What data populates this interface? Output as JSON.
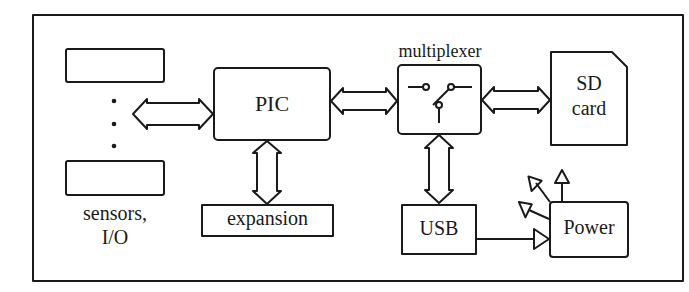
{
  "diagram": {
    "type": "block-diagram",
    "blocks": {
      "sensor_top": "",
      "sensor_bottom": "",
      "sensors_label_line1": "sensors,",
      "sensors_label_line2": "I/O",
      "pic": "PIC",
      "expansion": "expansion",
      "multiplexer": "multiplexer",
      "sd_line1": "SD",
      "sd_line2": "card",
      "usb": "USB",
      "power": "Power"
    },
    "connections": [
      {
        "from": "sensors",
        "to": "PIC",
        "kind": "bidirectional-bus"
      },
      {
        "from": "PIC",
        "to": "expansion",
        "kind": "bidirectional-bus"
      },
      {
        "from": "PIC",
        "to": "multiplexer",
        "kind": "bidirectional-bus"
      },
      {
        "from": "multiplexer",
        "to": "SD card",
        "kind": "bidirectional-bus"
      },
      {
        "from": "multiplexer",
        "to": "USB",
        "kind": "bidirectional-bus"
      },
      {
        "from": "USB",
        "to": "Power",
        "kind": "arrow"
      },
      {
        "from": "Power",
        "to": "outputs",
        "kind": "arrow",
        "count": 3
      }
    ],
    "colors": {
      "stroke": "#1a1a1a",
      "background": "#ffffff"
    }
  }
}
